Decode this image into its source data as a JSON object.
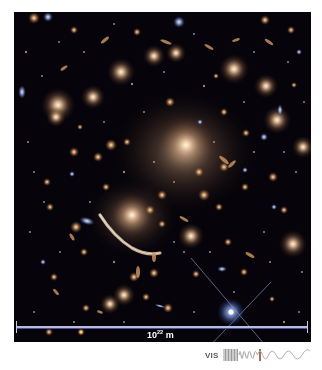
{
  "image": {
    "subject": "galaxy-cluster-deep-field",
    "description": "Deep-field image of a galaxy cluster with a gravitationally lensed arc and a bright foreground star with diffraction spikes",
    "colors": {
      "background": "#06040a",
      "galaxy_glow": "#e2b78d",
      "star_blue": "#a8c0ff",
      "scale_bar": "#b9bddc"
    }
  },
  "scale_bar": {
    "base": "10",
    "exponent": "22",
    "unit": "m"
  },
  "legend": {
    "band_label": "VIS",
    "band_colors": {
      "gradient_start": "#8a8a8a",
      "highlight": "#8b4a2a",
      "wave": "#b0b0b0"
    }
  }
}
